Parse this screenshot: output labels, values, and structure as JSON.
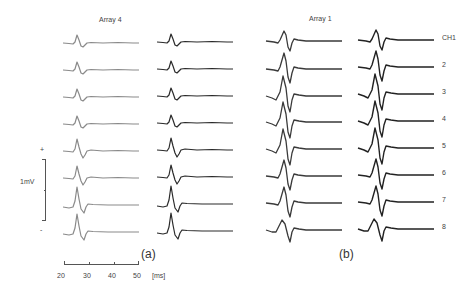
{
  "figure": {
    "panels": [
      {
        "id": "a",
        "title": "Array 4",
        "panel_label": "(a)",
        "columns": 2,
        "rows": 8
      },
      {
        "id": "b",
        "title": "Array 1",
        "panel_label": "(b)",
        "columns": 2,
        "rows": 8
      }
    ],
    "channel_labels": [
      "CH1",
      "2",
      "3",
      "4",
      "5",
      "6",
      "7",
      "8"
    ],
    "voltage_scale": {
      "label": "1mV",
      "plus": "+",
      "minus": "-"
    },
    "time_axis": {
      "ticks": [
        "20",
        "30",
        "40",
        "50"
      ],
      "unit": "[ms]"
    },
    "colors": {
      "trace_light": "#8a8a8a",
      "trace_dark": "#2a2a2a",
      "axis": "#555555",
      "text": "#444444"
    }
  }
}
